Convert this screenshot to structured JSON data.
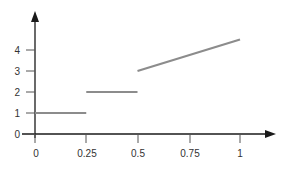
{
  "chart_data": {
    "type": "line",
    "title": "",
    "xlabel": "",
    "ylabel": "",
    "xlim": [
      0,
      1
    ],
    "ylim": [
      0,
      4.8
    ],
    "x_ticks": [
      "0",
      "0.25",
      "0.5",
      "0.75",
      "1"
    ],
    "y_ticks": [
      "0",
      "1",
      "2",
      "3",
      "4"
    ],
    "grid": false,
    "legend": null,
    "series": [
      {
        "name": "segment-1",
        "x": [
          0,
          0.25
        ],
        "y": [
          1,
          1
        ]
      },
      {
        "name": "segment-2",
        "x": [
          0.25,
          0.5
        ],
        "y": [
          2,
          2
        ]
      },
      {
        "name": "segment-3",
        "x": [
          0.5,
          1
        ],
        "y": [
          3,
          4.5
        ]
      }
    ],
    "colors": {
      "axis": "#1a1a1a",
      "line": "#8c8c8c",
      "text": "#333333"
    }
  }
}
